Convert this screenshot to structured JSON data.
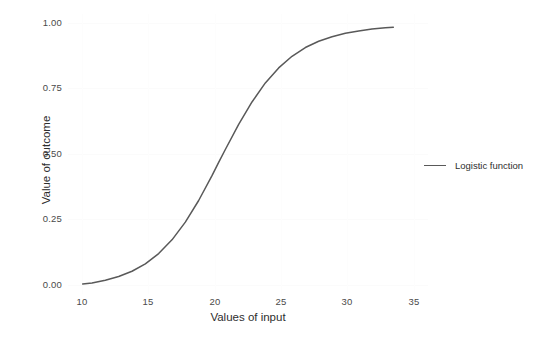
{
  "chart_data": {
    "type": "line",
    "title": "",
    "xlabel": "Values of input",
    "ylabel": "Value of outcome",
    "xlim": [
      9.2,
      36.2
    ],
    "ylim": [
      -0.02,
      1.04
    ],
    "grid": true,
    "legend_position": "right",
    "xticks": [
      10,
      15,
      20,
      25,
      30,
      35
    ],
    "xticklabels": [
      "10",
      "15",
      "20",
      "25",
      "30",
      "35"
    ],
    "yticks": [
      0.0,
      0.25,
      0.5,
      0.75,
      1.0
    ],
    "yticklabels": [
      "0.00",
      "0.25",
      "0.50",
      "0.75",
      "1.00"
    ],
    "line_color": "#595959",
    "series": [
      {
        "name": "Logistic function",
        "color": "#595959",
        "x": [
          10.3,
          11.0,
          12.0,
          13.0,
          14.0,
          15.0,
          16.0,
          17.0,
          18.0,
          19.0,
          20.0,
          20.5,
          21.0,
          22.0,
          23.0,
          24.0,
          25.0,
          26.0,
          27.0,
          28.0,
          29.0,
          30.0,
          31.0,
          32.0,
          33.0,
          33.6
        ],
        "y": [
          0.018,
          0.022,
          0.032,
          0.046,
          0.066,
          0.094,
          0.133,
          0.185,
          0.252,
          0.334,
          0.428,
          0.478,
          0.527,
          0.622,
          0.707,
          0.779,
          0.836,
          0.88,
          0.913,
          0.937,
          0.954,
          0.967,
          0.976,
          0.983,
          0.988,
          0.99
        ]
      }
    ]
  },
  "legend": {
    "entries": [
      {
        "label": "Logistic function",
        "color": "#595959"
      }
    ]
  },
  "axes": {
    "x_title": "Values of input",
    "y_title": "Value of outcome"
  }
}
